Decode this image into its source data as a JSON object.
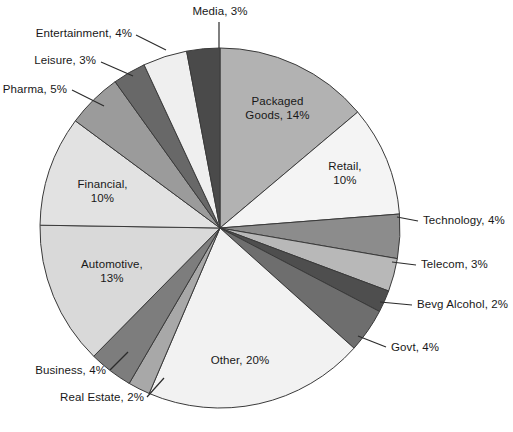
{
  "chart_data": {
    "type": "pie",
    "title": "",
    "subtitle": "",
    "xlabel": "",
    "ylabel": "",
    "legend_position": "none",
    "grid": false,
    "value_unit": "%",
    "start_angle_deg": 0,
    "direction": "clockwise",
    "total": 101,
    "categories": [
      "Packaged Goods",
      "Retail",
      "Technology",
      "Telecom",
      "Bevg Alcohol",
      "Govt",
      "Other",
      "Real Estate",
      "Business",
      "Automotive",
      "Financial",
      "Pharma",
      "Leisure",
      "Entertainment",
      "Media"
    ],
    "values": [
      14,
      10,
      4,
      3,
      2,
      4,
      20,
      2,
      4,
      13,
      10,
      5,
      3,
      4,
      3
    ],
    "colors": [
      "#b2b2b2",
      "#f4f4f4",
      "#8c8c8c",
      "#b8b8b8",
      "#4e4e4e",
      "#6e6e6e",
      "#f2f2f2",
      "#a8a8a8",
      "#7d7d7d",
      "#d9d9d9",
      "#e2e2e2",
      "#9b9b9b",
      "#686868",
      "#efefef",
      "#4a4a4a"
    ],
    "slices": [
      {
        "label": "Packaged Goods, 14%",
        "name": "Packaged Goods",
        "value": 14,
        "color": "#b2b2b2",
        "label_placement": "inner"
      },
      {
        "label": "Retail,\n10%",
        "name": "Retail",
        "value": 10,
        "color": "#f4f4f4",
        "label_placement": "inner"
      },
      {
        "label": "Technology, 4%",
        "name": "Technology",
        "value": 4,
        "color": "#8c8c8c",
        "label_placement": "outer-right"
      },
      {
        "label": "Telecom, 3%",
        "name": "Telecom",
        "value": 3,
        "color": "#b8b8b8",
        "label_placement": "outer-right"
      },
      {
        "label": "Bevg Alcohol, 2%",
        "name": "Bevg Alcohol",
        "value": 2,
        "color": "#4e4e4e",
        "label_placement": "outer-right"
      },
      {
        "label": "Govt, 4%",
        "name": "Govt",
        "value": 4,
        "color": "#6e6e6e",
        "label_placement": "outer-right"
      },
      {
        "label": "Other, 20%",
        "name": "Other",
        "value": 20,
        "color": "#f2f2f2",
        "label_placement": "inner"
      },
      {
        "label": "Real Estate, 2%",
        "name": "Real Estate",
        "value": 2,
        "color": "#a8a8a8",
        "label_placement": "outer-left"
      },
      {
        "label": "Business, 4%",
        "name": "Business",
        "value": 4,
        "color": "#7d7d7d",
        "label_placement": "outer-left"
      },
      {
        "label": "Automotive,\n13%",
        "name": "Automotive",
        "value": 13,
        "color": "#d9d9d9",
        "label_placement": "inner"
      },
      {
        "label": "Financial,\n10%",
        "name": "Financial",
        "value": 10,
        "color": "#e2e2e2",
        "label_placement": "inner"
      },
      {
        "label": "Pharma, 5%",
        "name": "Pharma",
        "value": 5,
        "color": "#9b9b9b",
        "label_placement": "outer-left"
      },
      {
        "label": "Leisure, 3%",
        "name": "Leisure",
        "value": 3,
        "color": "#686868",
        "label_placement": "outer-left"
      },
      {
        "label": "Entertainment, 4%",
        "name": "Entertainment",
        "value": 4,
        "color": "#efefef",
        "label_placement": "outer-left"
      },
      {
        "label": "Media, 3%",
        "name": "Media",
        "value": 3,
        "color": "#4a4a4a",
        "label_placement": "outer-center"
      }
    ]
  },
  "labels": {
    "packaged_goods": "Packaged\nGoods, 14%",
    "retail": "Retail,\n10%",
    "technology": "Technology, 4%",
    "telecom": "Telecom, 3%",
    "bevg_alcohol": "Bevg Alcohol, 2%",
    "govt": "Govt, 4%",
    "other": "Other, 20%",
    "real_estate": "Real Estate, 2%",
    "business": "Business, 4%",
    "automotive": "Automotive,\n13%",
    "financial": "Financial,\n10%",
    "pharma": "Pharma, 5%",
    "leisure": "Leisure, 3%",
    "entertainment": "Entertainment, 4%",
    "media": "Media, 3%"
  },
  "geometry": {
    "center_x": 220,
    "center_y": 228,
    "radius": 180
  },
  "style": {
    "background": "#ffffff",
    "stroke": "#3a3a3a",
    "text": "#181818"
  }
}
